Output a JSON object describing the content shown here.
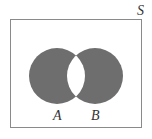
{
  "diagram": {
    "type": "venn",
    "operation": "symmetric-difference",
    "universe": {
      "label": "S",
      "x": 10,
      "y": 19,
      "width": 131,
      "height": 108,
      "stroke": "#8a8a8a"
    },
    "sets": [
      {
        "label": "A",
        "cx": 57,
        "cy": 76,
        "r": 28,
        "fill": "#6e6e6e",
        "shaded": "A only"
      },
      {
        "label": "B",
        "cx": 95,
        "cy": 76,
        "r": 28,
        "fill": "#6e6e6e",
        "shaded": "B only"
      }
    ],
    "intersection": {
      "fill": "#ffffff",
      "shaded": false
    },
    "colors": {
      "shade": "#6e6e6e",
      "background": "#ffffff",
      "border": "#8a8a8a",
      "text": "#333333"
    }
  }
}
